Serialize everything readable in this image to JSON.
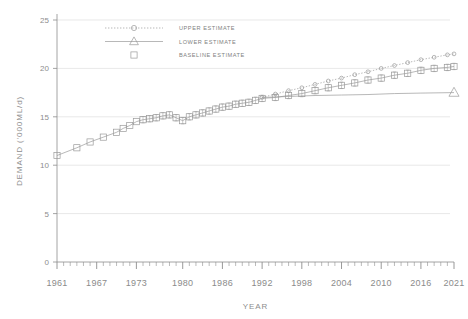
{
  "chart_data": {
    "type": "line",
    "title": "",
    "xlabel": "YEAR",
    "ylabel": "DEMAND ('000ML/d)",
    "xlim": [
      1961,
      2021
    ],
    "ylim": [
      0,
      25
    ],
    "yticks": [
      0,
      5,
      10,
      15,
      20,
      25
    ],
    "xticks": [
      1961,
      1967,
      1973,
      1980,
      1986,
      1992,
      1998,
      2004,
      2010,
      2016,
      2021
    ],
    "xtick_labels": [
      "1961",
      "1967",
      "1973",
      "1980",
      "1986",
      "1992",
      "1998",
      "2004",
      "2010",
      "2016",
      "2021"
    ],
    "ytick_labels": [
      "0",
      "5",
      "10",
      "15",
      "20",
      "25"
    ],
    "grid": true,
    "grid_axis": "y",
    "legend_position": "top-left-inside",
    "minor_xticks_interval": 1,
    "series": [
      {
        "name": "UPPER ESTIMATE",
        "marker": "circle-open",
        "line_style": "dotted",
        "color": "#9a9a9a",
        "x": [
          1992,
          1994,
          1996,
          1998,
          2000,
          2002,
          2004,
          2006,
          2008,
          2010,
          2012,
          2014,
          2016,
          2018,
          2020,
          2021
        ],
        "values": [
          17.0,
          17.35,
          17.7,
          18.0,
          18.35,
          18.7,
          19.0,
          19.35,
          19.65,
          20.0,
          20.3,
          20.6,
          20.9,
          21.15,
          21.4,
          21.5
        ]
      },
      {
        "name": "LOWER ESTIMATE",
        "marker": "triangle-open",
        "line_style": "solid",
        "color": "#9a9a9a",
        "x": [
          1992,
          1996,
          2000,
          2004,
          2008,
          2012,
          2016,
          2021
        ],
        "values": [
          17.0,
          17.1,
          17.2,
          17.25,
          17.3,
          17.4,
          17.45,
          17.5
        ]
      },
      {
        "name": "BASELINE ESTIMATE",
        "marker": "square-open",
        "line_style": "solid-with-errorbars",
        "color": "#9a9a9a",
        "x": [
          1961,
          1964,
          1966,
          1968,
          1970,
          1971,
          1972,
          1973,
          1974,
          1975,
          1976,
          1977,
          1978,
          1979,
          1980,
          1981,
          1982,
          1983,
          1984,
          1985,
          1986,
          1987,
          1988,
          1989,
          1990,
          1991,
          1992,
          1994,
          1996,
          1998,
          2000,
          2002,
          2004,
          2006,
          2008,
          2010,
          2012,
          2014,
          2016,
          2018,
          2020,
          2021
        ],
        "values": [
          11.0,
          11.8,
          12.4,
          12.9,
          13.4,
          13.8,
          14.1,
          14.5,
          14.7,
          14.8,
          14.9,
          15.1,
          15.2,
          14.9,
          14.6,
          15.0,
          15.2,
          15.4,
          15.6,
          15.8,
          16.0,
          16.1,
          16.3,
          16.4,
          16.5,
          16.7,
          16.9,
          17.0,
          17.2,
          17.4,
          17.7,
          18.0,
          18.25,
          18.5,
          18.8,
          19.0,
          19.3,
          19.5,
          19.8,
          20.0,
          20.1,
          20.2
        ]
      }
    ],
    "legend": [
      {
        "label": "UPPER ESTIMATE",
        "marker": "circle-open",
        "line_style": "dotted"
      },
      {
        "label": "LOWER ESTIMATE",
        "marker": "triangle-open",
        "line_style": "solid"
      },
      {
        "label": "BASELINE ESTIMATE",
        "marker": "square-open",
        "line_style": "none"
      }
    ],
    "colors": {
      "axis": "#8d8d8d",
      "grid": "#d9d9d9",
      "series": "#9a9a9a",
      "text": "#8b8b8b",
      "background": "#ffffff"
    }
  }
}
